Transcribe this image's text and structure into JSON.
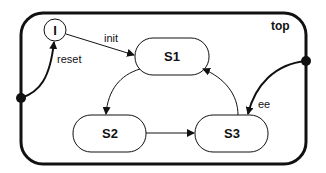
{
  "diagram": {
    "type": "state-machine",
    "container": {
      "label": "top"
    },
    "initial": {
      "label": "I"
    },
    "states": [
      {
        "id": "S1",
        "label": "S1"
      },
      {
        "id": "S2",
        "label": "S2"
      },
      {
        "id": "S3",
        "label": "S3"
      }
    ],
    "transitions": [
      {
        "from": "I",
        "to": "S1",
        "label": "init"
      },
      {
        "from": "left-junction",
        "to": "I",
        "label": "reset"
      },
      {
        "from": "S1",
        "to": "S2",
        "label": ""
      },
      {
        "from": "S2",
        "to": "S3",
        "label": ""
      },
      {
        "from": "S3",
        "to": "S1",
        "label": ""
      },
      {
        "from": "right-junction",
        "to": "S3",
        "label": "ee"
      }
    ],
    "colors": {
      "stroke": "#111111",
      "background": "#ffffff"
    }
  }
}
